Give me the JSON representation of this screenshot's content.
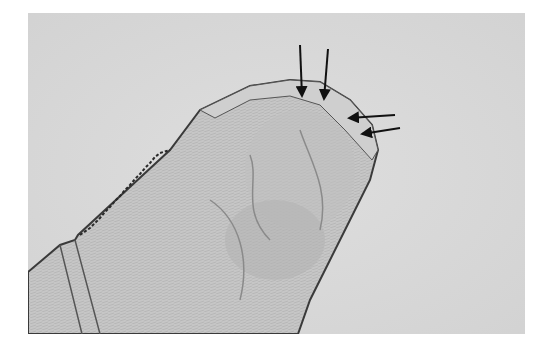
{
  "figure": {
    "description": "Light micrograph of the anterior end of a nematode showing cephalic structures",
    "background_color": "#dcdcdc",
    "specimen_color": "#c4c4c4",
    "outline_color": "#3a3a3a",
    "arrow_color": "#111111",
    "annotations": [
      {
        "type": "arrow",
        "direction": "down",
        "tip": [
          302,
          98
        ]
      },
      {
        "type": "arrow",
        "direction": "down",
        "tip": [
          324,
          101
        ]
      },
      {
        "type": "arrow",
        "direction": "left",
        "tip": [
          347,
          118
        ]
      },
      {
        "type": "arrow",
        "direction": "left",
        "tip": [
          360,
          134
        ]
      }
    ]
  }
}
